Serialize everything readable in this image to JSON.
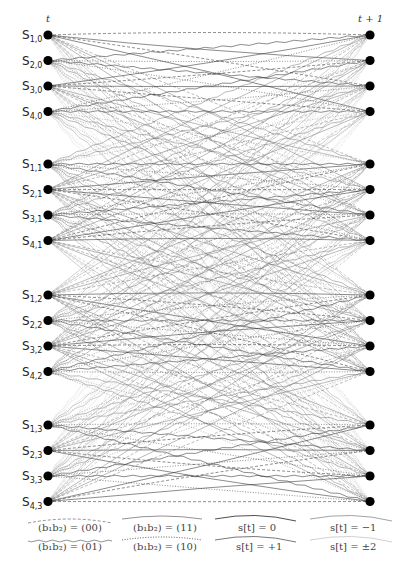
{
  "diagram": {
    "type": "trellis",
    "time_left": "t",
    "time_right": "t + 1",
    "states": [
      {
        "label": "S",
        "sub": "1,0"
      },
      {
        "label": "S",
        "sub": "2,0"
      },
      {
        "label": "S",
        "sub": "3,0"
      },
      {
        "label": "S",
        "sub": "4,0"
      },
      {
        "label": "S",
        "sub": "1,1"
      },
      {
        "label": "S",
        "sub": "2,1"
      },
      {
        "label": "S",
        "sub": "3,1"
      },
      {
        "label": "S",
        "sub": "4,1"
      },
      {
        "label": "S",
        "sub": "1,2"
      },
      {
        "label": "S",
        "sub": "2,2"
      },
      {
        "label": "S",
        "sub": "3,2"
      },
      {
        "label": "S",
        "sub": "4,2"
      },
      {
        "label": "S",
        "sub": "1,3"
      },
      {
        "label": "S",
        "sub": "2,3"
      },
      {
        "label": "S",
        "sub": "3,3"
      },
      {
        "label": "S",
        "sub": "4,3"
      }
    ],
    "groups": 4,
    "states_per_group": 4,
    "edge_styles": {
      "00": "dashed",
      "01": "wavy",
      "11": "solid",
      "10": "dotted"
    },
    "shade_by_symbol": {
      "0": "#222222",
      "+1": "#555555",
      "-1": "#8a8a8a",
      "±2": "#c4c4c4"
    }
  },
  "legend": {
    "line_style": [
      {
        "key": "00",
        "label": "(b₁b₂) = (00)",
        "style": "dashed"
      },
      {
        "key": "01",
        "label": "(b₁b₂) = (01)",
        "style": "wavy"
      },
      {
        "key": "11",
        "label": "(b₁b₂) = (11)",
        "style": "solid"
      },
      {
        "key": "10",
        "label": "(b₁b₂) = (10)",
        "style": "dotted"
      }
    ],
    "shade": [
      {
        "key": "0",
        "label": "s[t] = 0"
      },
      {
        "key": "+1",
        "label": "s[t] = +1"
      },
      {
        "key": "-1",
        "label": "s[t] = −1"
      },
      {
        "key": "±2",
        "label": "s[t] = ±2"
      }
    ]
  }
}
